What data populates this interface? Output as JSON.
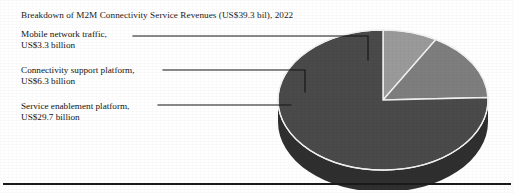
{
  "figure": {
    "title": "Breakdown of M2M Connectivity Service Revenues (US$39.3 bil), 2022",
    "background_color": "#ffffff",
    "footer_rule_color": "#1a1a1a"
  },
  "callouts": [
    {
      "line1": "Mobile network traffic,",
      "line2": "US$3.3 billion"
    },
    {
      "line1": "Connectivity support platform,",
      "line2": "US$6.3 billion"
    },
    {
      "line1": "Service enablement platform,",
      "line2": "US$29.7 billion"
    }
  ],
  "chart_data": {
    "type": "pie",
    "title": "Breakdown of M2M Connectivity Service Revenues (US$39.3 bil), 2022",
    "xlabel": "",
    "ylabel": "",
    "unit": "US$ billion",
    "total": 39.3,
    "three_d": true,
    "legend_position": "callout-labels-left",
    "grid": false,
    "categories": [
      "Mobile network traffic",
      "Connectivity support platform",
      "Service enablement platform"
    ],
    "values": [
      3.3,
      6.3,
      29.7
    ],
    "value_labels": [
      "US$3.3 billion",
      "US$6.3 billion",
      "US$29.7 billion"
    ],
    "percentages": [
      8.4,
      16.0,
      75.6
    ],
    "slice_colors": [
      "#9a9a9a",
      "#7e7e7e",
      "#4a4a4a"
    ],
    "slice_side_colors": [
      "#6d6d6d",
      "#5a5a5a",
      "#2e2e2e"
    ],
    "slice_edge_color": "#f2f2f2",
    "start_angle_deg": 0,
    "direction": "clockwise"
  }
}
